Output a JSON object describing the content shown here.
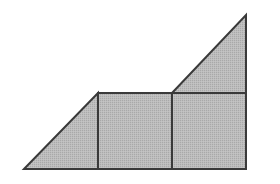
{
  "diagram": {
    "background": "#ffffff",
    "fill_color": "#b8b8b8",
    "stroke_color": "#3a3a3a",
    "stroke_width": 2,
    "points": {
      "bottom_left": [
        24,
        169
      ],
      "bottom_right": [
        246,
        169
      ],
      "top_apex": [
        246,
        15
      ],
      "mid_left": [
        98,
        93
      ],
      "mid_center": [
        172,
        93
      ],
      "mid_right": [
        246,
        93
      ],
      "bottom_mid_left": [
        98,
        169
      ],
      "bottom_mid_center": [
        172,
        169
      ]
    },
    "shapes": [
      {
        "name": "left-triangle",
        "type": "triangle",
        "points": [
          [
            24,
            169
          ],
          [
            98,
            93
          ],
          [
            98,
            169
          ]
        ]
      },
      {
        "name": "middle-square",
        "type": "rectangle",
        "points": [
          [
            98,
            93
          ],
          [
            172,
            93
          ],
          [
            172,
            169
          ],
          [
            98,
            169
          ]
        ]
      },
      {
        "name": "right-square",
        "type": "rectangle",
        "points": [
          [
            172,
            93
          ],
          [
            246,
            93
          ],
          [
            246,
            169
          ],
          [
            172,
            169
          ]
        ]
      },
      {
        "name": "top-triangle",
        "type": "triangle",
        "points": [
          [
            172,
            93
          ],
          [
            246,
            15
          ],
          [
            246,
            93
          ]
        ]
      }
    ]
  }
}
